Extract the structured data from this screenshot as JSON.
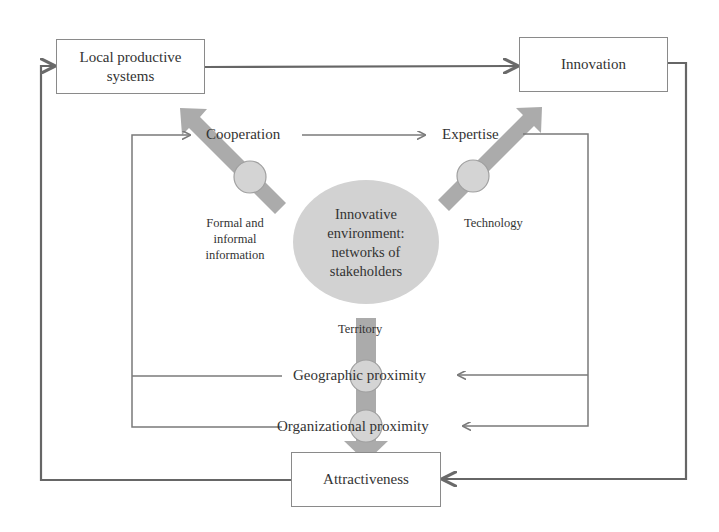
{
  "diagram": {
    "nodes": {
      "local_productive_systems": "Local productive systems",
      "innovation": "Innovation",
      "attractiveness": "Attractiveness",
      "center": "Innovative environment: networks of stakeholders"
    },
    "center_lines": [
      "Innovative",
      "environment:",
      "networks of",
      "stakeholders"
    ],
    "labels": {
      "cooperation": "Cooperation",
      "expertise": "Expertise",
      "formal_informal": "Formal and informal information",
      "technology": "Technology",
      "territory": "Territory",
      "geographic_proximity": "Geographic proximity",
      "organizational_proximity": "Organizational proximity"
    },
    "colors": {
      "line": "#6f6f6f",
      "thick_arrow": "#a9a9a9",
      "circle_fill": "#d4d4d4",
      "circle_stroke": "#a0a0a0",
      "box_border": "#8a8a8a"
    }
  }
}
